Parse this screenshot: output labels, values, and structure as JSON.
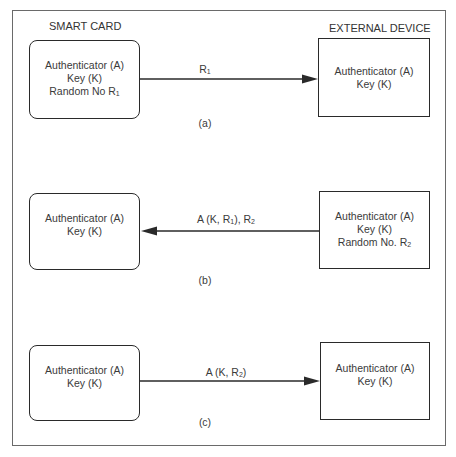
{
  "headers": {
    "left": "SMART CARD",
    "right": "EXTERNAL DEVICE"
  },
  "panels": [
    {
      "caption": "(a)",
      "smart_card": {
        "lines": [
          "Authenticator (A)",
          "Key (K)",
          "Random No R"
        ],
        "subscripts": [
          "",
          "",
          "1"
        ]
      },
      "external_device": {
        "lines": [
          "Authenticator (A)",
          "Key (K)"
        ],
        "subscripts": [
          "",
          ""
        ]
      },
      "message": {
        "text": "R",
        "subscript": "1",
        "suffix": ""
      },
      "direction": "card-to-device"
    },
    {
      "caption": "(b)",
      "smart_card": {
        "lines": [
          "Authenticator (A)",
          "Key (K)"
        ],
        "subscripts": [
          "",
          ""
        ]
      },
      "external_device": {
        "lines": [
          "Authenticator (A)",
          "Key (K)",
          "Random No. R"
        ],
        "subscripts": [
          "",
          "",
          "2"
        ]
      },
      "message": {
        "text": "A (K, R",
        "subscript": "1",
        "suffix": "), R",
        "subscript2": "2"
      },
      "direction": "device-to-card"
    },
    {
      "caption": "(c)",
      "smart_card": {
        "lines": [
          "Authenticator (A)",
          "Key (K)"
        ],
        "subscripts": [
          "",
          ""
        ]
      },
      "external_device": {
        "lines": [
          "Authenticator (A)",
          "Key (K)"
        ],
        "subscripts": [
          "",
          ""
        ]
      },
      "message": {
        "text": "A (K, R",
        "subscript": "2",
        "suffix": ")"
      },
      "direction": "card-to-device"
    }
  ],
  "colors": {
    "line": "#2a2a2a",
    "frame": "#6a6a6a",
    "text": "#3a3a3a",
    "background": "#ffffff"
  }
}
